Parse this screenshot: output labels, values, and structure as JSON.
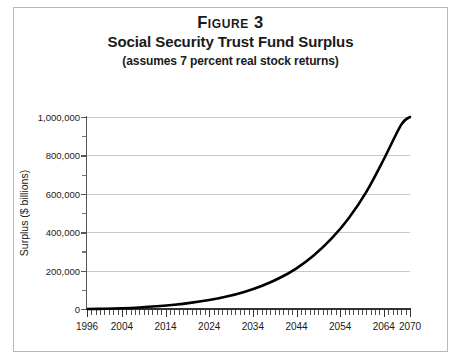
{
  "figure": {
    "number_label": "Figure 3",
    "title": "Social Security Trust Fund Surplus",
    "subtitle": "(assumes 7 percent real stock returns)"
  },
  "chart_data": {
    "type": "line",
    "title": "Social Security Trust Fund Surplus",
    "subtitle": "(assumes 7 percent real stock returns)",
    "figure_number": "Figure 3",
    "xlabel": "",
    "ylabel": "Surplus ($ billions)",
    "xlim": [
      1996,
      2070
    ],
    "ylim": [
      0,
      1000000
    ],
    "grid": "horizontal-major",
    "legend": "none",
    "x_tick_labels": [
      "1996",
      "2004",
      "2014",
      "2024",
      "2034",
      "2044",
      "2054",
      "2064",
      "2070"
    ],
    "x_tick_values": [
      1996,
      2004,
      2014,
      2024,
      2034,
      2044,
      2054,
      2064,
      2070
    ],
    "x_minor_tick_interval": 1,
    "y_tick_labels": [
      "0",
      "200,000",
      "400,000",
      "600,000",
      "800,000",
      "1,000,000"
    ],
    "y_tick_values": [
      0,
      200000,
      400000,
      600000,
      800000,
      1000000
    ],
    "y_minor_tick_values": [
      100000,
      300000,
      500000,
      700000,
      900000
    ],
    "series": [
      {
        "name": "Trust Fund Surplus",
        "color": "#000000",
        "x": [
          1996,
          2000,
          2004,
          2008,
          2012,
          2016,
          2020,
          2024,
          2028,
          2032,
          2036,
          2040,
          2044,
          2048,
          2052,
          2056,
          2060,
          2064,
          2068,
          2070
        ],
        "values": [
          0,
          1500,
          4000,
          8000,
          14000,
          22000,
          33000,
          47000,
          65000,
          89000,
          120000,
          160000,
          212000,
          280000,
          366000,
          474000,
          610000,
          780000,
          960000,
          1000000
        ]
      }
    ]
  }
}
